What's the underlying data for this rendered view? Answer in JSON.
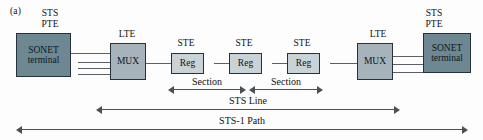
{
  "figure": {
    "panel_label": "(a)"
  },
  "nodes": [
    {
      "id": "left-terminal",
      "label": "SONET\nterminal",
      "cap": "STS\nPTE",
      "type": "terminal"
    },
    {
      "id": "left-mux",
      "label": "MUX",
      "cap": "LTE",
      "type": "mux"
    },
    {
      "id": "reg-1",
      "label": "Reg",
      "cap": "STE",
      "type": "reg"
    },
    {
      "id": "reg-2",
      "label": "Reg",
      "cap": "STE",
      "type": "reg"
    },
    {
      "id": "reg-3",
      "label": "Reg",
      "cap": "STE",
      "type": "reg"
    },
    {
      "id": "right-mux",
      "label": "MUX",
      "cap": "LTE",
      "type": "mux"
    },
    {
      "id": "right-terminal",
      "label": "SONET\nterminal",
      "cap": "STS\nPTE",
      "type": "terminal"
    }
  ],
  "spans": [
    {
      "id": "section-1",
      "label": "Section"
    },
    {
      "id": "section-2",
      "label": "Section"
    },
    {
      "id": "sts-line",
      "label": "STS Line"
    },
    {
      "id": "sts-path",
      "label": "STS-1 Path"
    }
  ],
  "colors": {
    "terminal_fill": "#6d8793",
    "mux_fill": "#a6b3bb",
    "reg_fill": "#c9d2d6",
    "stroke": "#26323a",
    "line": "#5a6066",
    "arrow": "#4a5055",
    "background": "#fdfdfd"
  }
}
